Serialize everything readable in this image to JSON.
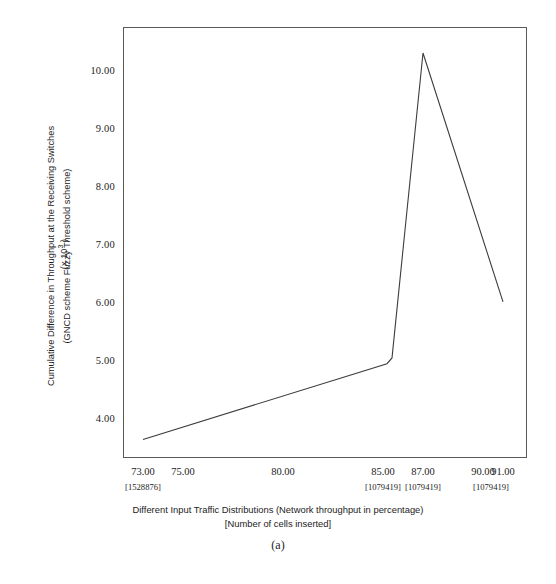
{
  "figure": {
    "caption": "(a)"
  },
  "chart_data": {
    "type": "line",
    "title": "",
    "xlabel": "Different Input Traffic Distributions (Network throughput in percentage) [Number of cells inserted]",
    "xlabel_line1": "Different Input Traffic Distributions (Network throughput in percentage)",
    "xlabel_line2": "[Number of cells inserted]",
    "ylabel": "Cumulative Difference in Throughput at the Receiving Switches (GNCD scheme  Fuzzy Threshold scheme)",
    "ylabel_line1": "Cumulative Difference in Throughput at the Receiving Switches",
    "ylabel_line2": "(GNCD scheme  Fuzzy Threshold scheme)",
    "y_units": "(x 10",
    "y_units_exp": "3",
    "y_units_close": " )",
    "xlim": [
      72.0,
      92.2
    ],
    "ylim": [
      3.3,
      10.75
    ],
    "grid": false,
    "legend": null,
    "y_ticks": [
      {
        "value": 4.0,
        "label": "4.00"
      },
      {
        "value": 5.0,
        "label": "5.00"
      },
      {
        "value": 6.0,
        "label": "6.00"
      },
      {
        "value": 7.0,
        "label": "7.00"
      },
      {
        "value": 8.0,
        "label": "8.00"
      },
      {
        "value": 9.0,
        "label": "9.00"
      },
      {
        "value": 10.0,
        "label": "10.00"
      }
    ],
    "x_ticks": [
      {
        "value": 73.0,
        "label": "73.00",
        "bracket": "[1528876]"
      },
      {
        "value": 75.0,
        "label": "75.00",
        "bracket": ""
      },
      {
        "value": 80.0,
        "label": "80.00",
        "bracket": ""
      },
      {
        "value": 85.0,
        "label": "85.00",
        "bracket": "[1079419]"
      },
      {
        "value": 87.0,
        "label": "87.00",
        "bracket": "[1079419]"
      },
      {
        "value": 90.0,
        "label": "90.00",
        "bracket": ""
      },
      {
        "value": 91.0,
        "label": "91.00",
        "bracket": "[1079419]"
      }
    ],
    "bracket_overrides": [
      {
        "x": 90.5,
        "label": "[1079419]"
      }
    ],
    "series": [
      {
        "name": "Cumulative throughput difference",
        "color": "#3c3c3c",
        "x": [
          73.0,
          85.2,
          85.45,
          87.0,
          91.0
        ],
        "y": [
          3.62,
          4.93,
          5.03,
          10.3,
          6.0
        ]
      }
    ]
  }
}
